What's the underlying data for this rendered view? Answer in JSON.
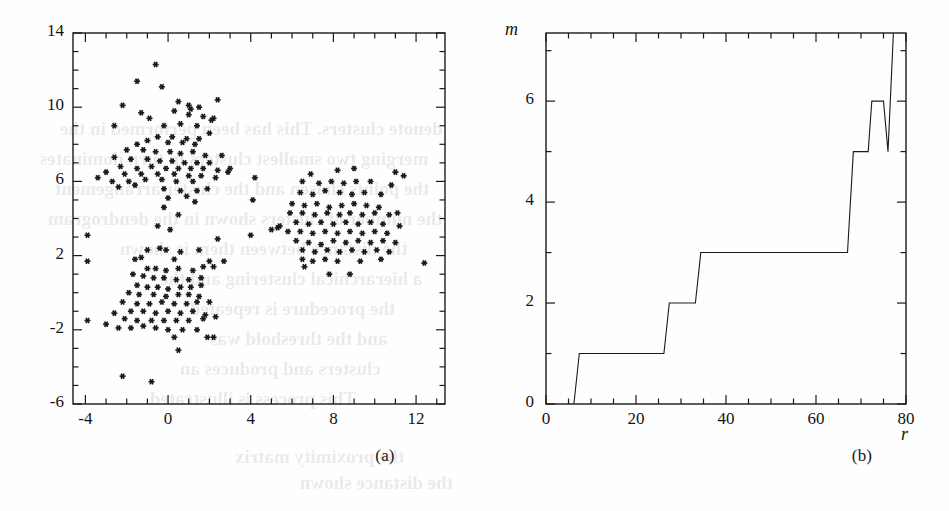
{
  "figure": {
    "background_color": "#fefefe",
    "ink_color": "#1a1a1a",
    "panels": [
      {
        "id": "a",
        "caption": "(a)",
        "caption_x": 385,
        "caption_y": 457
      },
      {
        "id": "b",
        "caption": "(b)",
        "caption_x": 862,
        "caption_y": 457
      }
    ]
  },
  "ghost_text": [
    {
      "text": "denote clusters. This has been performed in the",
      "x": 60,
      "y": 118,
      "size": 19
    },
    {
      "text": "merging two smallest clusters in turn dominates",
      "x": 40,
      "y": 148,
      "size": 19
    },
    {
      "text": "the points chosen and the cluster arrangement",
      "x": 55,
      "y": 178,
      "size": 19
    },
    {
      "text": "the number of clusters shown in the dendrogram",
      "x": 48,
      "y": 208,
      "size": 19
    },
    {
      "text": "the distance between them is shown",
      "x": 120,
      "y": 238,
      "size": 19
    },
    {
      "text": "a hierarchical clustering and the",
      "x": 160,
      "y": 268,
      "size": 19
    },
    {
      "text": "the procedure is repeated",
      "x": 190,
      "y": 298,
      "size": 19
    },
    {
      "text": "and the threshold was",
      "x": 210,
      "y": 328,
      "size": 19
    },
    {
      "text": "clusters and produces an",
      "x": 180,
      "y": 358,
      "size": 19
    },
    {
      "text": "This process is illustrated",
      "x": 150,
      "y": 388,
      "size": 19
    },
    {
      "text": "the proximity matrix",
      "x": 235,
      "y": 446,
      "size": 19
    },
    {
      "text": "the distance shown",
      "x": 300,
      "y": 472,
      "size": 19
    }
  ],
  "chart_data": [
    {
      "type": "scatter",
      "panel": "a",
      "title": "",
      "xlabel": "",
      "ylabel": "",
      "xlim": [
        -4.6,
        13.4
      ],
      "ylim": [
        -6,
        14
      ],
      "xticks": [
        -4,
        0,
        4,
        8,
        12
      ],
      "xticklabels": [
        "-4",
        "0",
        "4",
        "8",
        "12"
      ],
      "yticks": [
        -6,
        -2,
        2,
        6,
        10,
        14
      ],
      "yticklabels": [
        "-6",
        "-2",
        "2",
        "6",
        "10",
        "14"
      ],
      "x_minor_step": 1,
      "y_minor_step": 1,
      "grid": false,
      "legend": null,
      "marker": "asterisk",
      "marker_color": "#1a1a1a",
      "marker_size": 6,
      "clusters": [
        {
          "name": "upper-left",
          "center": [
            0.2,
            7.4
          ],
          "n": 96
        },
        {
          "name": "lower-left",
          "center": [
            0.1,
            0.3
          ],
          "n": 86
        },
        {
          "name": "right",
          "center": [
            8.3,
            3.9
          ],
          "n": 84
        }
      ],
      "points": [
        [
          -0.6,
          12.3
        ],
        [
          -1.5,
          11.4
        ],
        [
          -0.3,
          11.1
        ],
        [
          -2.2,
          10.1
        ],
        [
          0.5,
          10.3
        ],
        [
          1.0,
          10.1
        ],
        [
          1.5,
          10.0
        ],
        [
          2.4,
          10.4
        ],
        [
          1.1,
          9.9
        ],
        [
          0.3,
          9.8
        ],
        [
          -1.3,
          9.7
        ],
        [
          -0.9,
          9.4
        ],
        [
          1.0,
          9.6
        ],
        [
          1.7,
          9.5
        ],
        [
          2.1,
          9.3
        ],
        [
          -2.6,
          9.0
        ],
        [
          -0.2,
          9.0
        ],
        [
          0.6,
          9.1
        ],
        [
          1.4,
          9.0
        ],
        [
          2.2,
          9.4
        ],
        [
          -0.5,
          8.4
        ],
        [
          0.2,
          8.4
        ],
        [
          0.9,
          8.3
        ],
        [
          1.5,
          8.3
        ],
        [
          -1.0,
          8.2
        ],
        [
          -1.5,
          8.0
        ],
        [
          0.0,
          8.1
        ],
        [
          0.7,
          8.1
        ],
        [
          1.3,
          8.0
        ],
        [
          2.0,
          8.6
        ],
        [
          -2.0,
          7.7
        ],
        [
          -1.2,
          7.7
        ],
        [
          -0.6,
          7.6
        ],
        [
          0.1,
          7.6
        ],
        [
          0.6,
          7.5
        ],
        [
          1.2,
          7.6
        ],
        [
          1.8,
          7.4
        ],
        [
          2.6,
          7.4
        ],
        [
          -2.6,
          7.3
        ],
        [
          -1.8,
          7.2
        ],
        [
          -1.0,
          7.2
        ],
        [
          -0.4,
          7.1
        ],
        [
          0.2,
          7.1
        ],
        [
          0.8,
          7.0
        ],
        [
          1.4,
          7.0
        ],
        [
          2.0,
          7.0
        ],
        [
          -2.3,
          6.8
        ],
        [
          -1.5,
          6.7
        ],
        [
          -0.8,
          6.8
        ],
        [
          -0.1,
          6.7
        ],
        [
          0.5,
          6.7
        ],
        [
          1.1,
          6.7
        ],
        [
          1.7,
          6.7
        ],
        [
          2.4,
          6.6
        ],
        [
          3.0,
          6.7
        ],
        [
          -3.0,
          6.5
        ],
        [
          -2.1,
          6.4
        ],
        [
          -1.3,
          6.4
        ],
        [
          -0.5,
          6.4
        ],
        [
          0.3,
          6.4
        ],
        [
          1.0,
          6.3
        ],
        [
          1.6,
          6.3
        ],
        [
          2.3,
          6.2
        ],
        [
          -3.4,
          6.2
        ],
        [
          -2.7,
          6.0
        ],
        [
          -1.9,
          6.0
        ],
        [
          -1.1,
          6.1
        ],
        [
          -0.3,
          6.1
        ],
        [
          0.4,
          6.0
        ],
        [
          1.2,
          6.0
        ],
        [
          2.9,
          6.5
        ],
        [
          4.2,
          6.2
        ],
        [
          -2.4,
          5.7
        ],
        [
          -1.6,
          5.8
        ],
        [
          -0.2,
          5.6
        ],
        [
          0.6,
          5.5
        ],
        [
          1.4,
          5.5
        ],
        [
          1.9,
          5.6
        ],
        [
          0.0,
          5.1
        ],
        [
          0.9,
          5.2
        ],
        [
          1.3,
          4.9
        ],
        [
          4.1,
          5.0
        ],
        [
          -0.2,
          4.6
        ],
        [
          0.5,
          4.2
        ],
        [
          -0.5,
          3.6
        ],
        [
          0.1,
          3.4
        ],
        [
          4.0,
          3.1
        ],
        [
          5.0,
          3.4
        ],
        [
          5.4,
          3.6
        ],
        [
          -3.9,
          3.1
        ],
        [
          -3.9,
          1.7
        ],
        [
          2.4,
          2.9
        ],
        [
          -1.0,
          2.3
        ],
        [
          -0.4,
          2.4
        ],
        [
          -0.1,
          2.3
        ],
        [
          0.6,
          2.2
        ],
        [
          1.5,
          2.3
        ],
        [
          -1.3,
          1.9
        ],
        [
          -1.6,
          1.8
        ],
        [
          0.3,
          1.8
        ],
        [
          2.0,
          1.7
        ],
        [
          2.7,
          1.7
        ],
        [
          -1.0,
          1.3
        ],
        [
          -0.6,
          1.3
        ],
        [
          -0.1,
          1.2
        ],
        [
          0.5,
          1.3
        ],
        [
          1.2,
          1.2
        ],
        [
          1.7,
          1.4
        ],
        [
          2.2,
          1.4
        ],
        [
          -1.7,
          1.0
        ],
        [
          -1.2,
          0.9
        ],
        [
          -0.7,
          0.8
        ],
        [
          -0.2,
          0.8
        ],
        [
          0.4,
          0.7
        ],
        [
          1.0,
          0.7
        ],
        [
          1.6,
          0.8
        ],
        [
          -1.5,
          0.4
        ],
        [
          -1.0,
          0.3
        ],
        [
          -0.5,
          0.3
        ],
        [
          0.0,
          0.2
        ],
        [
          0.6,
          0.3
        ],
        [
          1.1,
          0.3
        ],
        [
          1.6,
          0.4
        ],
        [
          -1.9,
          0.0
        ],
        [
          -1.4,
          -0.1
        ],
        [
          -0.7,
          -0.1
        ],
        [
          -0.1,
          -0.2
        ],
        [
          0.5,
          -0.1
        ],
        [
          1.0,
          -0.1
        ],
        [
          1.5,
          -0.2
        ],
        [
          -2.2,
          -0.5
        ],
        [
          -1.5,
          -0.6
        ],
        [
          -0.9,
          -0.6
        ],
        [
          -0.3,
          -0.5
        ],
        [
          0.3,
          -0.6
        ],
        [
          0.9,
          -0.6
        ],
        [
          1.4,
          -0.5
        ],
        [
          2.0,
          -0.5
        ],
        [
          -1.8,
          -1.0
        ],
        [
          -1.2,
          -1.0
        ],
        [
          -0.6,
          -1.1
        ],
        [
          0.0,
          -1.0
        ],
        [
          0.6,
          -1.1
        ],
        [
          1.2,
          -1.0
        ],
        [
          1.8,
          -1.2
        ],
        [
          -2.6,
          -1.1
        ],
        [
          -2.1,
          -1.4
        ],
        [
          -1.5,
          -1.5
        ],
        [
          -0.8,
          -1.5
        ],
        [
          -0.2,
          -1.5
        ],
        [
          0.4,
          -1.5
        ],
        [
          1.0,
          -1.5
        ],
        [
          1.7,
          -1.4
        ],
        [
          2.3,
          -1.3
        ],
        [
          -3.0,
          -1.7
        ],
        [
          -2.4,
          -1.9
        ],
        [
          -1.8,
          -1.9
        ],
        [
          -1.2,
          -1.8
        ],
        [
          -0.6,
          -1.9
        ],
        [
          0.0,
          -2.0
        ],
        [
          0.7,
          -2.0
        ],
        [
          1.4,
          -2.0
        ],
        [
          -3.9,
          -1.5
        ],
        [
          0.3,
          -2.4
        ],
        [
          1.9,
          -2.4
        ],
        [
          2.2,
          -2.4
        ],
        [
          0.5,
          -3.1
        ],
        [
          -2.2,
          -4.5
        ],
        [
          -0.8,
          -4.8
        ],
        [
          6.9,
          6.4
        ],
        [
          8.2,
          6.6
        ],
        [
          9.0,
          6.7
        ],
        [
          11.0,
          6.5
        ],
        [
          11.4,
          6.3
        ],
        [
          6.5,
          6.0
        ],
        [
          7.3,
          5.9
        ],
        [
          7.9,
          6.0
        ],
        [
          8.5,
          5.9
        ],
        [
          9.1,
          6.0
        ],
        [
          9.8,
          6.0
        ],
        [
          10.8,
          5.8
        ],
        [
          6.4,
          5.4
        ],
        [
          7.0,
          5.3
        ],
        [
          7.6,
          5.5
        ],
        [
          8.3,
          5.4
        ],
        [
          8.9,
          5.3
        ],
        [
          9.5,
          5.4
        ],
        [
          10.3,
          5.3
        ],
        [
          6.0,
          4.8
        ],
        [
          6.6,
          4.7
        ],
        [
          7.2,
          4.8
        ],
        [
          7.8,
          4.6
        ],
        [
          8.4,
          4.7
        ],
        [
          9.0,
          4.8
        ],
        [
          9.6,
          4.7
        ],
        [
          10.2,
          4.6
        ],
        [
          5.9,
          4.3
        ],
        [
          6.5,
          4.3
        ],
        [
          7.1,
          4.2
        ],
        [
          7.7,
          4.3
        ],
        [
          8.3,
          4.2
        ],
        [
          8.8,
          4.3
        ],
        [
          9.4,
          4.2
        ],
        [
          10.0,
          4.3
        ],
        [
          10.7,
          4.2
        ],
        [
          11.1,
          4.3
        ],
        [
          6.2,
          3.8
        ],
        [
          6.8,
          3.7
        ],
        [
          7.4,
          3.8
        ],
        [
          8.0,
          3.7
        ],
        [
          8.6,
          3.8
        ],
        [
          9.2,
          3.7
        ],
        [
          9.8,
          3.8
        ],
        [
          10.4,
          3.7
        ],
        [
          11.2,
          3.6
        ],
        [
          5.3,
          3.5
        ],
        [
          5.8,
          3.3
        ],
        [
          6.4,
          3.3
        ],
        [
          7.0,
          3.2
        ],
        [
          7.6,
          3.3
        ],
        [
          8.2,
          3.2
        ],
        [
          8.8,
          3.3
        ],
        [
          9.4,
          3.2
        ],
        [
          10.0,
          3.3
        ],
        [
          10.6,
          3.2
        ],
        [
          6.2,
          2.8
        ],
        [
          6.8,
          2.7
        ],
        [
          7.4,
          2.6
        ],
        [
          8.0,
          2.8
        ],
        [
          8.6,
          2.7
        ],
        [
          9.2,
          2.8
        ],
        [
          9.8,
          2.7
        ],
        [
          10.4,
          2.8
        ],
        [
          11.0,
          2.7
        ],
        [
          6.5,
          2.3
        ],
        [
          7.1,
          2.2
        ],
        [
          7.7,
          2.3
        ],
        [
          8.3,
          2.2
        ],
        [
          8.9,
          2.3
        ],
        [
          9.5,
          2.2
        ],
        [
          10.1,
          2.3
        ],
        [
          10.7,
          2.2
        ],
        [
          6.5,
          1.8
        ],
        [
          7.0,
          1.7
        ],
        [
          7.6,
          1.8
        ],
        [
          8.2,
          1.7
        ],
        [
          9.3,
          1.7
        ],
        [
          10.3,
          1.8
        ],
        [
          6.6,
          1.4
        ],
        [
          7.8,
          1.0
        ],
        [
          8.8,
          1.0
        ],
        [
          12.4,
          1.6
        ]
      ]
    },
    {
      "type": "line",
      "panel": "b",
      "title": "",
      "xlabel": "r",
      "ylabel": "m",
      "xlim": [
        0,
        80
      ],
      "ylim": [
        0,
        7.35
      ],
      "xticks": [
        0,
        20,
        40,
        60,
        80
      ],
      "xticklabels": [
        "0",
        "20",
        "40",
        "60",
        "80"
      ],
      "yticks": [
        0,
        2,
        4,
        6
      ],
      "yticklabels": [
        "0",
        "2",
        "4",
        "6"
      ],
      "x_minor_step": 5,
      "y_minor_step": 1,
      "grid": false,
      "legend": null,
      "line_color": "#1a1a1a",
      "line_width": 1.1,
      "step_points": [
        [
          6.2,
          0.0
        ],
        [
          7.4,
          1.0
        ],
        [
          26.2,
          1.0
        ],
        [
          27.4,
          2.0
        ],
        [
          33.2,
          2.0
        ],
        [
          34.4,
          3.0
        ],
        [
          67.0,
          3.0
        ],
        [
          68.3,
          5.0
        ],
        [
          71.6,
          5.0
        ],
        [
          72.4,
          6.0
        ],
        [
          75.0,
          6.0
        ],
        [
          76.0,
          5.0
        ],
        [
          77.2,
          7.35
        ]
      ]
    }
  ]
}
